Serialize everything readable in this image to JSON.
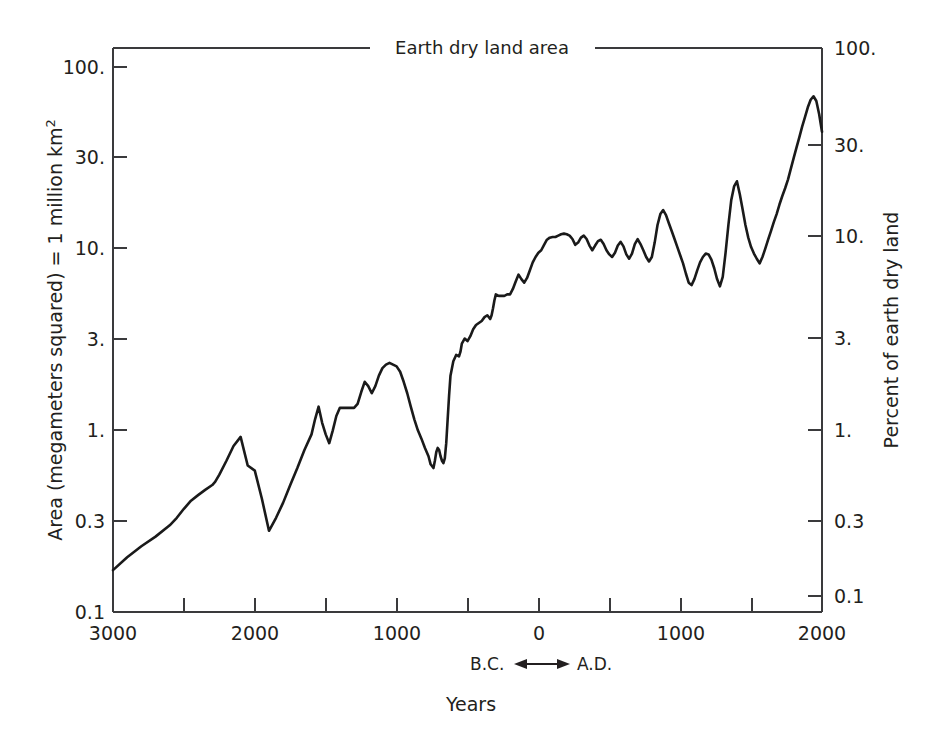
{
  "chart_data": {
    "type": "line",
    "title": "Earth dry land area",
    "xlabel": "Years",
    "ylabel": "Area (megameters squared) = 1 million km²",
    "y2label": "Percent of earth dry land",
    "era_left": "B.C.",
    "era_right": "A.D.",
    "xlim": [
      -3000,
      2000
    ],
    "ylim": [
      0.1,
      130
    ],
    "yscale": "log",
    "grid": false,
    "legend": "none",
    "xticks": [
      -3000,
      -2500,
      -2000,
      -1500,
      -1000,
      -500,
      0,
      500,
      1000,
      1500,
      2000
    ],
    "xtick_labels": [
      "3000",
      "",
      "2000",
      "",
      "1000",
      "",
      "0",
      "",
      "1000",
      "",
      "2000"
    ],
    "yticks": [
      0.1,
      0.3,
      1,
      3,
      10,
      30,
      100
    ],
    "ytick_labels": [
      "0.1",
      "0.3",
      "1.",
      "3.",
      "10.",
      "30.",
      "100."
    ],
    "y2ticks": [
      0.1,
      0.3,
      1,
      3,
      10,
      30,
      100
    ],
    "y2tick_labels": [
      "0.1",
      "0.3",
      "1.",
      "3.",
      "10.",
      "30.",
      "100."
    ],
    "series_name": "Area of largest empire",
    "x": [
      -3000,
      -2900,
      -2800,
      -2700,
      -2600,
      -2550,
      -2500,
      -2450,
      -2400,
      -2350,
      -2300,
      -2280,
      -2250,
      -2200,
      -2150,
      -2100,
      -2050,
      -2000,
      -1950,
      -1900,
      -1850,
      -1800,
      -1750,
      -1700,
      -1650,
      -1600,
      -1575,
      -1550,
      -1525,
      -1500,
      -1475,
      -1450,
      -1425,
      -1400,
      -1375,
      -1350,
      -1325,
      -1300,
      -1275,
      -1250,
      -1225,
      -1200,
      -1175,
      -1150,
      -1125,
      -1100,
      -1075,
      -1050,
      -1025,
      -1000,
      -975,
      -950,
      -925,
      -900,
      -875,
      -850,
      -825,
      -800,
      -775,
      -760,
      -740,
      -730,
      -720,
      -710,
      -700,
      -690,
      -680,
      -670,
      -660,
      -650,
      -640,
      -630,
      -620,
      -600,
      -580,
      -560,
      -550,
      -540,
      -520,
      -500,
      -480,
      -460,
      -440,
      -420,
      -400,
      -380,
      -360,
      -340,
      -330,
      -320,
      -310,
      -300,
      -280,
      -260,
      -240,
      -220,
      -200,
      -180,
      -160,
      -140,
      -120,
      -100,
      -80,
      -60,
      -40,
      -20,
      0,
      20,
      40,
      60,
      80,
      100,
      120,
      140,
      160,
      180,
      200,
      220,
      240,
      260,
      280,
      300,
      320,
      340,
      360,
      380,
      400,
      420,
      440,
      460,
      480,
      500,
      520,
      540,
      560,
      580,
      600,
      620,
      640,
      660,
      680,
      700,
      720,
      740,
      760,
      780,
      800,
      820,
      840,
      860,
      880,
      900,
      920,
      940,
      960,
      980,
      1000,
      1020,
      1040,
      1060,
      1080,
      1100,
      1120,
      1140,
      1160,
      1180,
      1200,
      1220,
      1240,
      1260,
      1280,
      1300,
      1320,
      1340,
      1360,
      1380,
      1400,
      1420,
      1440,
      1460,
      1480,
      1500,
      1520,
      1540,
      1560,
      1580,
      1600,
      1620,
      1640,
      1660,
      1680,
      1700,
      1720,
      1740,
      1760,
      1780,
      1800,
      1820,
      1840,
      1860,
      1880,
      1900,
      1920,
      1940,
      1960,
      1980,
      2000
    ],
    "y": [
      0.17,
      0.2,
      0.23,
      0.26,
      0.3,
      0.33,
      0.37,
      0.41,
      0.44,
      0.47,
      0.5,
      0.52,
      0.57,
      0.68,
      0.82,
      0.92,
      0.64,
      0.6,
      0.42,
      0.28,
      0.33,
      0.4,
      0.5,
      0.62,
      0.78,
      0.95,
      1.15,
      1.35,
      1.1,
      0.95,
      0.85,
      1.0,
      1.2,
      1.33,
      1.33,
      1.33,
      1.33,
      1.33,
      1.4,
      1.62,
      1.85,
      1.75,
      1.6,
      1.75,
      2.0,
      2.2,
      2.3,
      2.35,
      2.3,
      2.25,
      2.1,
      1.85,
      1.6,
      1.35,
      1.15,
      1.0,
      0.9,
      0.8,
      0.72,
      0.65,
      0.62,
      0.68,
      0.76,
      0.8,
      0.78,
      0.72,
      0.68,
      0.66,
      0.7,
      0.85,
      1.15,
      1.55,
      2.0,
      2.4,
      2.6,
      2.55,
      2.7,
      3.0,
      3.2,
      3.1,
      3.3,
      3.6,
      3.8,
      3.9,
      4.0,
      4.2,
      4.3,
      4.1,
      4.3,
      4.7,
      5.2,
      5.6,
      5.5,
      5.5,
      5.5,
      5.6,
      5.6,
      6.0,
      6.6,
      7.2,
      6.8,
      6.5,
      6.9,
      7.6,
      8.4,
      9.0,
      9.5,
      9.8,
      10.5,
      11.2,
      11.5,
      11.6,
      11.6,
      11.8,
      12.0,
      12.1,
      12.0,
      11.8,
      11.3,
      10.5,
      10.8,
      11.5,
      11.8,
      11.3,
      10.4,
      9.8,
      10.4,
      11.0,
      11.2,
      10.6,
      9.8,
      9.3,
      9.0,
      9.5,
      10.4,
      10.9,
      10.3,
      9.3,
      8.8,
      9.4,
      10.6,
      11.3,
      10.6,
      9.8,
      9.0,
      8.5,
      9.0,
      10.8,
      13.5,
      15.5,
      16.3,
      15.3,
      13.8,
      12.5,
      11.3,
      10.2,
      9.2,
      8.3,
      7.3,
      6.5,
      6.3,
      6.8,
      7.6,
      8.4,
      9.0,
      9.4,
      9.3,
      8.7,
      7.8,
      6.8,
      6.2,
      7.0,
      9.5,
      13.5,
      18.5,
      22.0,
      23.5,
      20.0,
      16.5,
      13.5,
      11.5,
      10.2,
      9.4,
      8.8,
      8.3,
      9.0,
      10.0,
      11.2,
      12.5,
      14.0,
      15.5,
      17.5,
      19.5,
      21.5,
      24.0,
      27.5,
      31.5,
      36.0,
      41.0,
      47.0,
      53.0,
      60.0,
      66.0,
      69.0,
      65.0,
      55.0,
      44.0,
      38.0,
      36.0
    ]
  }
}
